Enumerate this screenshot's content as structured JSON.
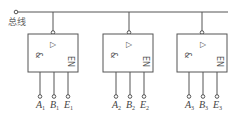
{
  "bus": {
    "label": "总线"
  },
  "gates": [
    {
      "id": 1,
      "and_symbol": "&",
      "tri_state_symbol": "▷",
      "enable_label": "EN",
      "inputs": [
        {
          "name": "A",
          "sub": "1"
        },
        {
          "name": "B",
          "sub": "1"
        },
        {
          "name": "E",
          "sub": "1"
        }
      ]
    },
    {
      "id": 2,
      "and_symbol": "&",
      "tri_state_symbol": "▷",
      "enable_label": "EN",
      "inputs": [
        {
          "name": "A",
          "sub": "2"
        },
        {
          "name": "B",
          "sub": "2"
        },
        {
          "name": "E",
          "sub": "2"
        }
      ]
    },
    {
      "id": 3,
      "and_symbol": "&",
      "tri_state_symbol": "▷",
      "enable_label": "EN",
      "inputs": [
        {
          "name": "A",
          "sub": "3"
        },
        {
          "name": "B",
          "sub": "3"
        },
        {
          "name": "E",
          "sub": "3"
        }
      ]
    }
  ]
}
